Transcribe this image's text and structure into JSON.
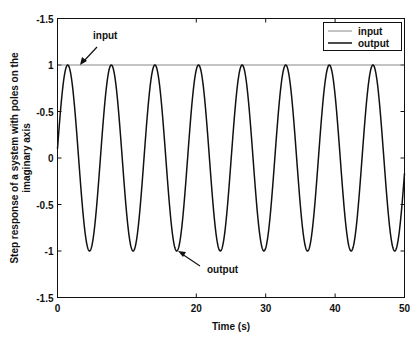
{
  "chart_data": {
    "type": "line",
    "title": "",
    "xlabel": "Time (s)",
    "ylabel": "Step response of a system with poles on the imaginary axis",
    "ylabel_lines": [
      "Step response of a system with poles on the",
      "imaginary axis"
    ],
    "xlim": [
      0,
      50
    ],
    "ylim": [
      -1.5,
      1.5
    ],
    "x_ticks": [
      0,
      20,
      30,
      40,
      50
    ],
    "x_tick_labels": [
      "0",
      "20",
      "30",
      "40",
      "50"
    ],
    "y_ticks": [
      1.5,
      1,
      0.5,
      0,
      -0.5,
      -1,
      -1.5
    ],
    "y_tick_labels": [
      "-1.5",
      "1",
      "-0.5",
      "0",
      "-0.5",
      "-1",
      "-1.5"
    ],
    "grid": false,
    "legend_position": "upper right",
    "series": [
      {
        "name": "input",
        "description": "constant step input",
        "y": 1,
        "color": "#888888",
        "line_width": 1
      },
      {
        "name": "output",
        "description": "sinusoidal oscillation, amplitude 1, period ~6.28 s (omega = 1 rad/s)",
        "function": "sin(t + 0.1)",
        "amplitude": 1,
        "angular_frequency": 1,
        "phase": 0.1,
        "color": "#111111",
        "line_width": 1.5
      }
    ],
    "annotations": [
      {
        "text": "input",
        "points_to": {
          "x": 3.3,
          "y": 1
        }
      },
      {
        "text": "output",
        "points_to": {
          "x": 17.3,
          "y": -1
        }
      }
    ]
  }
}
